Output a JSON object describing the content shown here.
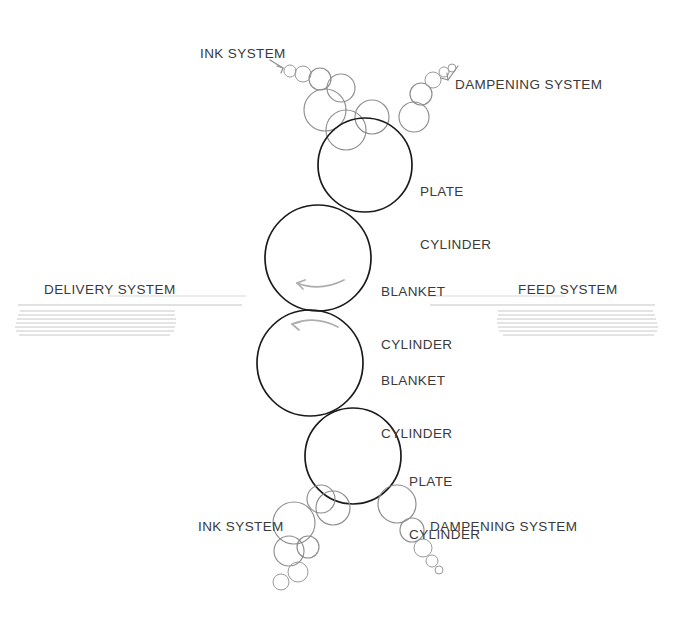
{
  "diagram": {
    "background_color": "#ffffff",
    "cylinder_stroke_color": "#1b1b1b",
    "roller_stroke_color": "#8d8d8d",
    "label_color": "#3a3a3a",
    "sheet_color": "#b9b9b9"
  },
  "labels": {
    "ink_system_top": "INK SYSTEM",
    "dampening_system_top": "DAMPENING SYSTEM",
    "plate_cylinder_top_line1": "PLATE",
    "plate_cylinder_top_line2": "CYLINDER",
    "blanket_cylinder_upper_line1": "BLANKET",
    "blanket_cylinder_upper_line2": "CYLINDER",
    "blanket_cylinder_lower_line1": "BLANKET",
    "blanket_cylinder_lower_line2": "CYLINDER",
    "plate_cylinder_bottom_line1": "PLATE",
    "plate_cylinder_bottom_line2": "CYLINDER",
    "delivery_system": "DELIVERY SYSTEM",
    "feed_system": "FEED SYSTEM",
    "ink_system_bottom": "INK SYSTEM",
    "dampening_system_bottom": "DAMPENING SYSTEM"
  },
  "components": {
    "cylinders": [
      {
        "name": "plate-cylinder-top",
        "cx": 365,
        "cy": 165,
        "r": 47
      },
      {
        "name": "blanket-cylinder-upper",
        "cx": 318,
        "cy": 258,
        "r": 53
      },
      {
        "name": "blanket-cylinder-lower",
        "cx": 310,
        "cy": 363,
        "r": 53
      },
      {
        "name": "plate-cylinder-bottom",
        "cx": 353,
        "cy": 456,
        "r": 48
      }
    ],
    "ink_train_top": [
      {
        "cx": 346,
        "cy": 130,
        "r": 20
      },
      {
        "cx": 325,
        "cy": 110,
        "r": 21
      },
      {
        "cx": 372,
        "cy": 117,
        "r": 17
      },
      {
        "cx": 341,
        "cy": 88,
        "r": 14
      },
      {
        "cx": 320,
        "cy": 79,
        "r": 11
      },
      {
        "cx": 303,
        "cy": 74,
        "r": 8
      },
      {
        "cx": 290,
        "cy": 71,
        "r": 6
      }
    ],
    "damp_train_top": [
      {
        "cx": 414,
        "cy": 117,
        "r": 15
      },
      {
        "cx": 421,
        "cy": 94,
        "r": 11
      },
      {
        "cx": 433,
        "cy": 80,
        "r": 8
      },
      {
        "cx": 444,
        "cy": 72,
        "r": 5
      },
      {
        "cx": 452,
        "cy": 68,
        "r": 4
      }
    ],
    "ink_train_bottom": [
      {
        "cx": 333,
        "cy": 508,
        "r": 17
      },
      {
        "cx": 294,
        "cy": 523,
        "r": 21
      },
      {
        "cx": 321,
        "cy": 499,
        "r": 14
      },
      {
        "cx": 289,
        "cy": 551,
        "r": 15
      },
      {
        "cx": 308,
        "cy": 547,
        "r": 11
      },
      {
        "cx": 298,
        "cy": 572,
        "r": 10
      },
      {
        "cx": 281,
        "cy": 582,
        "r": 8
      }
    ],
    "damp_train_bottom": [
      {
        "cx": 397,
        "cy": 504,
        "r": 19
      },
      {
        "cx": 412,
        "cy": 530,
        "r": 12
      },
      {
        "cx": 423,
        "cy": 548,
        "r": 9
      },
      {
        "cx": 432,
        "cy": 561,
        "r": 6
      },
      {
        "cx": 439,
        "cy": 570,
        "r": 4
      }
    ],
    "rotation_arrows": [
      {
        "name": "rotation-arrow-upper-blanket",
        "direction": "counter-clockwise"
      },
      {
        "name": "rotation-arrow-lower-blanket",
        "direction": "counter-clockwise"
      }
    ],
    "paper_path": {
      "delivery_side": "left",
      "feed_side": "right",
      "stack_lines": 7
    }
  }
}
